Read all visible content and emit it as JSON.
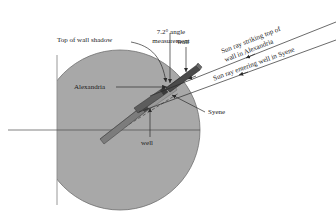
{
  "figure": {
    "name": "eratosthenes-earth-circumference-diagram",
    "colors": {
      "earth_fill": "#a8a8a8",
      "earth_stroke": "#6f6f6f",
      "line": "#2b2b2b",
      "structure_dark": "#4a4a4a",
      "structure_light": "#c9c9c9",
      "text": "#1a1a1a",
      "background": "#ffffff"
    },
    "labels": {
      "angle_measurement": "7.2° angle\nmeasurement",
      "top_of_wall_shadow": "Top of wall shadow",
      "wall": "wall",
      "alexandria": "Alexandria",
      "syene": "Syene",
      "well": "well",
      "sun_ray_wall": "Sun ray striking top of\nwall in Alexandria",
      "sun_ray_well": "Sun ray entering well in Syene"
    },
    "angle_value": "7.2°"
  }
}
